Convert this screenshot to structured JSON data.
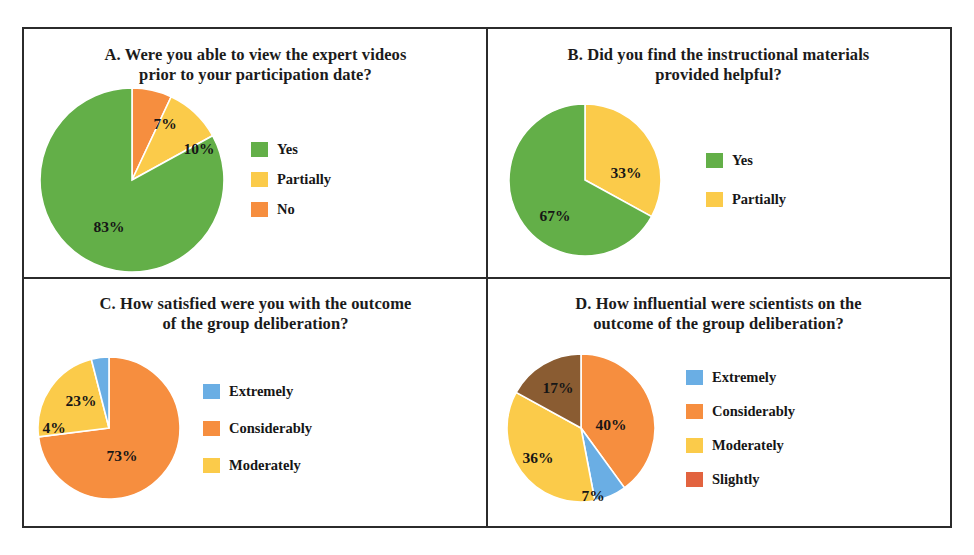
{
  "figure": {
    "border_color": "#2b2b2b",
    "background": "#ffffff"
  },
  "palette": {
    "green": "#63AF48",
    "yellow": "#FBCB4A",
    "orange": "#F68E3F",
    "blue": "#6AAEE4",
    "brown": "#8A5C32",
    "slightly_swatch": "#E2633F"
  },
  "chart_data": [
    {
      "id": "A",
      "type": "pie",
      "title": "A. Were you able to view the expert videos prior to your participation date?",
      "categories": [
        "Yes",
        "Partially",
        "No"
      ],
      "values": [
        83,
        10,
        7
      ],
      "value_labels": [
        "83%",
        "10%",
        "7%"
      ],
      "colors": [
        "#63AF48",
        "#FBCB4A",
        "#F68E3F"
      ],
      "units": "percent",
      "legend_position": "right",
      "draw_order_clockwise_from_top": [
        "No",
        "Partially",
        "Yes"
      ],
      "legend": [
        {
          "label": "Yes",
          "color": "#63AF48"
        },
        {
          "label": "Partially",
          "color": "#FBCB4A"
        },
        {
          "label": "No",
          "color": "#F68E3F"
        }
      ],
      "slices": [
        {
          "label": "No",
          "value": 7,
          "text": "7%",
          "color": "#F68E3F",
          "label_x": 126,
          "label_y": 37
        },
        {
          "label": "Partially",
          "value": 10,
          "text": "10%",
          "color": "#FBCB4A",
          "label_x": 160,
          "label_y": 62
        },
        {
          "label": "Yes",
          "value": 83,
          "text": "83%",
          "color": "#63AF48",
          "label_x": 70,
          "label_y": 140
        }
      ]
    },
    {
      "id": "B",
      "type": "pie",
      "title": "B. Did you find the instructional materials provided helpful?",
      "categories": [
        "Yes",
        "Partially"
      ],
      "values": [
        67,
        33
      ],
      "value_labels": [
        "67%",
        "33%"
      ],
      "colors": [
        "#63AF48",
        "#FBCB4A"
      ],
      "units": "percent",
      "legend_position": "right",
      "draw_order_clockwise_from_top": [
        "Partially",
        "Yes"
      ],
      "legend": [
        {
          "label": "Yes",
          "color": "#63AF48"
        },
        {
          "label": "Partially",
          "color": "#FBCB4A"
        }
      ],
      "slices": [
        {
          "label": "Partially",
          "value": 33,
          "text": "33%",
          "color": "#FBCB4A",
          "label_x": 118,
          "label_y": 70
        },
        {
          "label": "Yes",
          "value": 67,
          "text": "67%",
          "color": "#63AF48",
          "label_x": 47,
          "label_y": 113
        }
      ]
    },
    {
      "id": "C",
      "type": "pie",
      "title": "C. How satisfied were you with the outcome of the group deliberation?",
      "categories": [
        "Extremely",
        "Considerably",
        "Moderately"
      ],
      "values": [
        4,
        73,
        23
      ],
      "value_labels": [
        "4%",
        "73%",
        "23%"
      ],
      "colors": [
        "#6AAEE4",
        "#F68E3F",
        "#FBCB4A"
      ],
      "units": "percent",
      "legend_position": "right",
      "draw_order_clockwise_from_top": [
        "Considerably",
        "Moderately",
        "Extremely"
      ],
      "legend": [
        {
          "label": "Extremely",
          "color": "#6AAEE4"
        },
        {
          "label": "Considerably",
          "color": "#F68E3F"
        },
        {
          "label": "Moderately",
          "color": "#FBCB4A"
        }
      ],
      "slices": [
        {
          "label": "Considerably",
          "value": 73,
          "text": "73%",
          "color": "#F68E3F",
          "label_x": 85,
          "label_y": 100
        },
        {
          "label": "Moderately",
          "value": 23,
          "text": "23%",
          "color": "#FBCB4A",
          "label_x": 44,
          "label_y": 45
        },
        {
          "label": "Extremely",
          "value": 4,
          "text": "4%",
          "color": "#6AAEE4",
          "label_x": 17,
          "label_y": 72
        }
      ]
    },
    {
      "id": "D",
      "type": "pie",
      "title": "D. How influential were scientists on the outcome of the group deliberation?",
      "categories": [
        "Extremely",
        "Considerably",
        "Moderately",
        "Slightly"
      ],
      "values": [
        7,
        40,
        36,
        17
      ],
      "value_labels": [
        "7%",
        "40%",
        "36%",
        "17%"
      ],
      "colors": [
        "#6AAEE4",
        "#F68E3F",
        "#FBCB4A",
        "#8A5C32"
      ],
      "units": "percent",
      "legend_position": "right",
      "draw_order_clockwise_from_top": [
        "Considerably",
        "Extremely",
        "Moderately",
        "Slightly"
      ],
      "legend": [
        {
          "label": "Extremely",
          "color": "#6AAEE4"
        },
        {
          "label": "Considerably",
          "color": "#F68E3F"
        },
        {
          "label": "Moderately",
          "color": "#FBCB4A"
        },
        {
          "label": "Slightly",
          "color": "#E2633F"
        }
      ],
      "slices": [
        {
          "label": "Considerably",
          "value": 40,
          "text": "40%",
          "color": "#F68E3F",
          "label_x": 105,
          "label_y": 72
        },
        {
          "label": "Extremely",
          "value": 7,
          "text": "7%",
          "color": "#6AAEE4",
          "label_x": 87,
          "label_y": 143
        },
        {
          "label": "Moderately",
          "value": 36,
          "text": "36%",
          "color": "#FBCB4A",
          "label_x": 32,
          "label_y": 105
        },
        {
          "label": "Slightly",
          "value": 17,
          "text": "17%",
          "color": "#8A5C32",
          "label_x": 52,
          "label_y": 35
        }
      ]
    }
  ]
}
